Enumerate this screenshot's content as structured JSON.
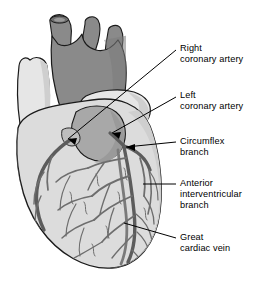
{
  "figure": {
    "background_color": "#ffffff",
    "width": 263,
    "height": 282
  },
  "palette": {
    "outline": "#1a1a1a",
    "aorta_fill": "#8a8a8a",
    "aorta_shadow": "#6e6e6e",
    "vessel_light_fill": "#e6e6e6",
    "myocardium_fill": "#dcdcdc",
    "myocardium_shade": "#cfcfcf",
    "atrium_fill": "#a8a8a8",
    "coronary_vessel": "#7a7a7a",
    "coronary_vessel_dark": "#5c5c5c",
    "leader_line": "#000000",
    "text": "#000000"
  },
  "labels": [
    {
      "id": "right-coronary-artery",
      "text": "Right\ncoronary artery",
      "x": 180,
      "y": 43,
      "leader": {
        "x1": 176,
        "y1": 50,
        "x2": 68,
        "y2": 139,
        "arrow": true
      }
    },
    {
      "id": "left-coronary-artery",
      "text": "Left\ncoronary artery",
      "x": 180,
      "y": 90,
      "leader": {
        "x1": 176,
        "y1": 97,
        "x2": 112,
        "y2": 133,
        "arrow": true
      }
    },
    {
      "id": "circumflex-branch",
      "text": "Circumflex\nbranch",
      "x": 180,
      "y": 136,
      "leader": {
        "x1": 176,
        "y1": 142,
        "x2": 126,
        "y2": 147,
        "arrow": true
      }
    },
    {
      "id": "anterior-interventricular-branch",
      "text": "Anterior\ninterventricular\nbranch",
      "x": 180,
      "y": 178,
      "leader": {
        "x1": 176,
        "y1": 184,
        "x2": 143,
        "y2": 184,
        "arrow": false
      }
    },
    {
      "id": "great-cardiac-vein",
      "text": "Great\ncardiac vein",
      "x": 180,
      "y": 232,
      "leader": {
        "x1": 176,
        "y1": 238,
        "x2": 124,
        "y2": 223,
        "arrow": false
      }
    }
  ],
  "anatomy": {
    "structures": [
      "aortic arch",
      "brachiocephalic trunk",
      "left common carotid artery",
      "left subclavian artery",
      "superior vena cava",
      "pulmonary trunk",
      "right atrium",
      "left atrium",
      "right ventricle",
      "left ventricle",
      "right coronary artery",
      "left coronary artery",
      "circumflex branch",
      "anterior interventricular branch",
      "great cardiac vein"
    ]
  }
}
